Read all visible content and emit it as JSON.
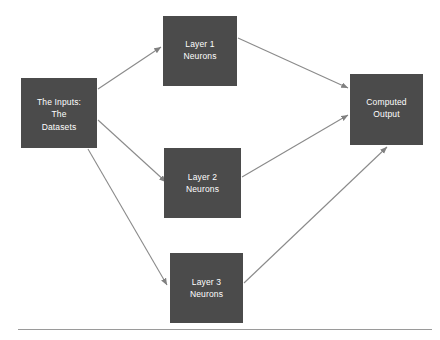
{
  "diagram": {
    "background_color": "#ffffff",
    "node_fill_color": "#4b4b4b",
    "node_text_color": "#ffffff",
    "arrow_color": "#808080",
    "rule_color": "#9a9a9a",
    "nodes": [
      {
        "id": "input",
        "name": "input-node",
        "lines": [
          "The Inputs:",
          "The",
          "Datasets"
        ]
      },
      {
        "id": "layer1",
        "name": "layer-1-node",
        "lines": [
          "Layer 1",
          "Neurons"
        ]
      },
      {
        "id": "layer2",
        "name": "layer-2-node",
        "lines": [
          "Layer 2",
          "Neurons"
        ]
      },
      {
        "id": "layer3",
        "name": "layer-3-node",
        "lines": [
          "Layer 3",
          "Neurons"
        ]
      },
      {
        "id": "output",
        "name": "output-node",
        "lines": [
          "Computed",
          "Output"
        ]
      }
    ],
    "edges": [
      {
        "id": "input-to-layer1",
        "from": "input",
        "to": "layer1",
        "x1": 98,
        "y1": 89,
        "x2": 161,
        "y2": 47
      },
      {
        "id": "input-to-layer2",
        "from": "input",
        "to": "layer2",
        "x1": 98,
        "y1": 120,
        "x2": 166,
        "y2": 182
      },
      {
        "id": "input-to-layer3",
        "from": "input",
        "to": "layer3",
        "x1": 88,
        "y1": 149,
        "x2": 167,
        "y2": 285
      },
      {
        "id": "layer1-to-output",
        "from": "layer1",
        "to": "output",
        "x1": 238,
        "y1": 38,
        "x2": 348,
        "y2": 88
      },
      {
        "id": "layer2-to-output",
        "from": "layer2",
        "to": "output",
        "x1": 242,
        "y1": 177,
        "x2": 348,
        "y2": 115
      },
      {
        "id": "layer3-to-output",
        "from": "layer3",
        "to": "output",
        "x1": 244,
        "y1": 283,
        "x2": 387,
        "y2": 147
      }
    ]
  }
}
